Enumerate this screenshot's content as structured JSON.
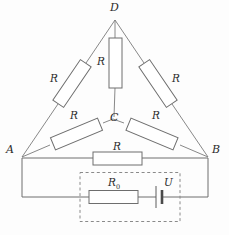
{
  "figure": {
    "type": "circuit-diagram",
    "background_color": "#fdfdfd",
    "line_color": "#6e6e6e",
    "label_color": "#2b2b2b"
  },
  "nodes": [
    {
      "id": "A",
      "label": "A",
      "x": 22,
      "y": 157
    },
    {
      "id": "B",
      "label": "B",
      "x": 208,
      "y": 157
    },
    {
      "id": "D",
      "label": "D",
      "x": 115,
      "y": 20
    },
    {
      "id": "C",
      "label": "C",
      "x": 113,
      "y": 119
    }
  ],
  "node_labels": [
    {
      "name": "node-label-D",
      "text": "D",
      "left": 110,
      "top": 2
    },
    {
      "name": "node-label-A",
      "text": "A",
      "left": 6,
      "top": 144
    },
    {
      "name": "node-label-B",
      "text": "B",
      "left": 212,
      "top": 144
    },
    {
      "name": "node-label-C",
      "text": "C",
      "left": 110,
      "top": 112
    }
  ],
  "resistors": [
    {
      "name": "resistor-DC",
      "label": "R",
      "branch": "D-C",
      "label_left": 97,
      "label_top": 56
    },
    {
      "name": "resistor-AD",
      "label": "R",
      "branch": "A-D",
      "label_left": 50,
      "label_top": 73
    },
    {
      "name": "resistor-BD",
      "label": "R",
      "branch": "B-D",
      "label_left": 172,
      "label_top": 73
    },
    {
      "name": "resistor-AC",
      "label": "R",
      "branch": "A-C",
      "label_left": 70,
      "label_top": 110
    },
    {
      "name": "resistor-BC",
      "label": "R",
      "branch": "B-C",
      "label_left": 152,
      "label_top": 110
    },
    {
      "name": "resistor-AB",
      "label": "R",
      "branch": "A-B",
      "label_left": 113,
      "label_top": 141
    }
  ],
  "source": {
    "internal_resistor_label": "R",
    "internal_resistor_subscript": "0",
    "internal_resistor_label_left": 108,
    "internal_resistor_label_top": 177,
    "emf_label": "U",
    "emf_label_left": 164,
    "emf_label_top": 177,
    "enclosure": "dashed-box"
  }
}
